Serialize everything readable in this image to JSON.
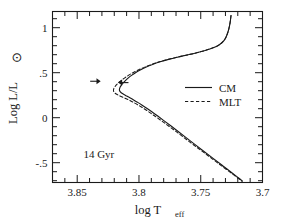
{
  "chart_data": {
    "type": "line",
    "title": "",
    "xlabel": "log T_eff",
    "xlabel_main": "log T",
    "xlabel_sub": "eff",
    "ylabel": "Log L/L⊙",
    "ylabel_main": "Log L/L",
    "ylabel_sub": "⊙",
    "xlim": [
      3.87,
      3.7
    ],
    "ylim": [
      -0.72,
      1.18
    ],
    "x_ticks": [
      3.85,
      3.8,
      3.75,
      3.7
    ],
    "x_tick_labels": [
      "3.85",
      "3.8",
      "3.75",
      "3.7"
    ],
    "x_minor_step": 0.01,
    "y_ticks": [
      1,
      0.5,
      0,
      -0.5
    ],
    "y_tick_labels": [
      "1",
      ".5",
      "0",
      "-.5"
    ],
    "y_minor_step": 0.1,
    "grid": false,
    "axis_direction": "x-reversed",
    "legend_position": "center-right",
    "annotations": [
      {
        "name": "age-label",
        "text": "14  Gyr",
        "x": 3.845,
        "y": -0.45
      },
      {
        "name": "arrow-mlt-turnoff",
        "text": "",
        "direction": "right",
        "x": 3.831,
        "y": 0.405
      },
      {
        "name": "arrow-cm-turnoff",
        "text": "",
        "direction": "left",
        "x": 3.817,
        "y": 0.39
      }
    ],
    "series": [
      {
        "name": "CM",
        "style": "solid",
        "color": "#1a1a1a",
        "points": [
          [
            3.7255,
            1.135
          ],
          [
            3.7262,
            1.06
          ],
          [
            3.7272,
            0.99
          ],
          [
            3.7285,
            0.93
          ],
          [
            3.7302,
            0.878
          ],
          [
            3.7325,
            0.838
          ],
          [
            3.7355,
            0.806
          ],
          [
            3.7395,
            0.779
          ],
          [
            3.744,
            0.757
          ],
          [
            3.7495,
            0.735
          ],
          [
            3.7555,
            0.714
          ],
          [
            3.762,
            0.694
          ],
          [
            3.769,
            0.672
          ],
          [
            3.776,
            0.648
          ],
          [
            3.7828,
            0.621
          ],
          [
            3.789,
            0.592
          ],
          [
            3.7945,
            0.561
          ],
          [
            3.799,
            0.53
          ],
          [
            3.8028,
            0.5
          ],
          [
            3.806,
            0.47
          ],
          [
            3.8088,
            0.44
          ],
          [
            3.811,
            0.412
          ],
          [
            3.8128,
            0.386
          ],
          [
            3.8142,
            0.362
          ],
          [
            3.8152,
            0.34
          ],
          [
            3.8157,
            0.322
          ],
          [
            3.8158,
            0.306
          ],
          [
            3.8154,
            0.292
          ],
          [
            3.8146,
            0.28
          ],
          [
            3.8134,
            0.268
          ],
          [
            3.8118,
            0.255
          ],
          [
            3.8098,
            0.24
          ],
          [
            3.8074,
            0.222
          ],
          [
            3.8046,
            0.2
          ],
          [
            3.8015,
            0.174
          ],
          [
            3.798,
            0.144
          ],
          [
            3.794,
            0.108
          ],
          [
            3.7896,
            0.066
          ],
          [
            3.7848,
            0.018
          ],
          [
            3.7796,
            -0.035
          ],
          [
            3.774,
            -0.093
          ],
          [
            3.768,
            -0.156
          ],
          [
            3.7616,
            -0.224
          ],
          [
            3.7548,
            -0.296
          ],
          [
            3.7476,
            -0.372
          ],
          [
            3.74,
            -0.452
          ],
          [
            3.732,
            -0.536
          ],
          [
            3.7238,
            -0.622
          ],
          [
            3.7185,
            -0.678
          ],
          [
            3.7162,
            -0.705
          ]
        ]
      },
      {
        "name": "MLT",
        "style": "dashed",
        "color": "#1a1a1a",
        "points": [
          [
            3.7255,
            1.135
          ],
          [
            3.7262,
            1.06
          ],
          [
            3.7272,
            0.99
          ],
          [
            3.7285,
            0.93
          ],
          [
            3.7302,
            0.878
          ],
          [
            3.7325,
            0.838
          ],
          [
            3.7355,
            0.806
          ],
          [
            3.7395,
            0.779
          ],
          [
            3.744,
            0.757
          ],
          [
            3.7495,
            0.735
          ],
          [
            3.7555,
            0.714
          ],
          [
            3.762,
            0.694
          ],
          [
            3.769,
            0.6725
          ],
          [
            3.776,
            0.6495
          ],
          [
            3.7828,
            0.6235
          ],
          [
            3.789,
            0.5955
          ],
          [
            3.7948,
            0.5655
          ],
          [
            3.7998,
            0.5355
          ],
          [
            3.8042,
            0.5055
          ],
          [
            3.808,
            0.4755
          ],
          [
            3.8112,
            0.4455
          ],
          [
            3.8142,
            0.4155
          ],
          [
            3.8166,
            0.388
          ],
          [
            3.8185,
            0.362
          ],
          [
            3.8198,
            0.338
          ],
          [
            3.8205,
            0.318
          ],
          [
            3.8206,
            0.3
          ],
          [
            3.8202,
            0.285
          ],
          [
            3.8193,
            0.272
          ],
          [
            3.818,
            0.26
          ],
          [
            3.8162,
            0.247
          ],
          [
            3.814,
            0.2335
          ],
          [
            3.8113,
            0.217
          ],
          [
            3.8082,
            0.197
          ],
          [
            3.8048,
            0.1725
          ],
          [
            3.801,
            0.1435
          ],
          [
            3.7968,
            0.108
          ],
          [
            3.7922,
            0.0665
          ],
          [
            3.7872,
            0.0185
          ],
          [
            3.7818,
            -0.034
          ],
          [
            3.776,
            -0.0925
          ],
          [
            3.7698,
            -0.1555
          ],
          [
            3.7633,
            -0.2235
          ],
          [
            3.7564,
            -0.2955
          ],
          [
            3.749,
            -0.3715
          ],
          [
            3.7412,
            -0.4515
          ],
          [
            3.7331,
            -0.5355
          ],
          [
            3.7247,
            -0.6215
          ],
          [
            3.7192,
            -0.6775
          ],
          [
            3.7168,
            -0.705
          ]
        ]
      }
    ],
    "legend_entries": [
      {
        "label": "CM",
        "style": "solid"
      },
      {
        "label": "MLT",
        "style": "dashed"
      }
    ]
  },
  "figure": {
    "background_color": "#ffffff",
    "foreground_color": "#1a1a1a"
  }
}
